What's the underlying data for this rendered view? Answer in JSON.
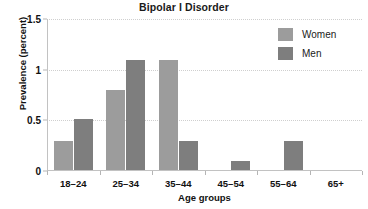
{
  "chart_data": {
    "type": "bar",
    "title": "Bipolar I Disorder",
    "xlabel": "Age groups",
    "ylabel": "Prevalence (percent)",
    "categories": [
      "18–24",
      "25–34",
      "35–44",
      "45–54",
      "55–64",
      "65+"
    ],
    "series": [
      {
        "name": "Women",
        "color": "#9c9c9c",
        "values": [
          0.3,
          0.8,
          1.1,
          0,
          0,
          0
        ]
      },
      {
        "name": "Men",
        "color": "#7e7e7e",
        "values": [
          0.51,
          1.1,
          0.3,
          0.1,
          0.3,
          0
        ]
      }
    ],
    "ylim": [
      0,
      1.5
    ],
    "yticks": [
      0,
      0.5,
      1,
      1.5
    ],
    "ytick_labels": [
      "0",
      "0.5",
      "1",
      "1.5"
    ],
    "grid": true,
    "grid_axis": "y",
    "grid_style": "dotted",
    "legend_position": "top-right",
    "background": "#ffffff"
  }
}
